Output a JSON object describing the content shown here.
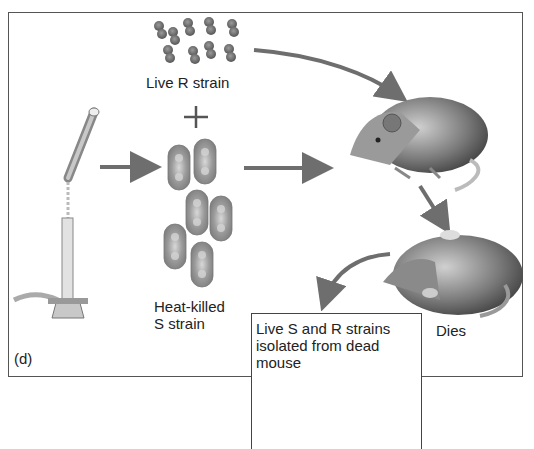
{
  "figure": {
    "panel_label": "(d)",
    "live_r_label": "Live R strain",
    "plus_sign": "+",
    "heat_killed_label_line1": "Heat-killed",
    "heat_killed_label_line2": "S strain",
    "outcome_label": "Dies",
    "inset_label": "Live S and R strains isolated from dead mouse"
  },
  "elements": {
    "burner": "bunsen-burner-heating-tube",
    "live_r_cells": "small paired rough R-strain bacteria cluster (9)",
    "heat_killed_s_cells": "large encapsulated S-strain bacteria (6)",
    "live_mouse": "mouse injected with mixture",
    "dead_mouse": "dead mouse lying on back",
    "inset_s_cells": "3 encapsulated S-strain cells",
    "inset_r_cells": "5 paired R-strain cells"
  },
  "colors": {
    "arrow": "#6e6e6e",
    "frame": "#555555",
    "cell_dark": "#6a6a6a",
    "cell_light": "#a8a8a8"
  }
}
